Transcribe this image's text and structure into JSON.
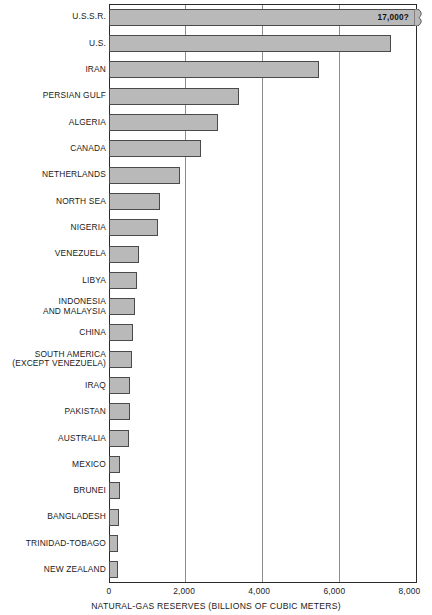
{
  "chart_data": {
    "type": "bar",
    "orientation": "horizontal",
    "title": "",
    "xlabel": "NATURAL-GAS RESERVES (BILLIONS OF CUBIC METERS)",
    "ylabel": "",
    "xlim": [
      0,
      8200
    ],
    "xticks": [
      0,
      2000,
      4000,
      6000,
      8000
    ],
    "xtick_labels": [
      "0",
      "2,000",
      "4,000",
      "6,000",
      "8,000"
    ],
    "grid": "vertical",
    "legend": "none",
    "bar_color": "#b9b9b9",
    "bar_edge_color": "#4a4a4a",
    "categories": [
      "U.S.S.R.",
      "U.S.",
      "IRAN",
      "PERSIAN GULF",
      "ALGERIA",
      "CANADA",
      "NETHERLANDS",
      "NORTH SEA",
      "NIGERIA",
      "VENEZUELA",
      "LIBYA",
      "INDONESIA\nAND MALAYSIA",
      "CHINA",
      "SOUTH AMERICA\n(EXCEPT VENEZUELA)",
      "IRAQ",
      "PAKISTAN",
      "AUSTRALIA",
      "MEXICO",
      "BRUNEI",
      "BANGLADESH",
      "TRINIDAD-TOBAGO",
      "NEW ZEALAND"
    ],
    "values": [
      17000,
      7500,
      5600,
      3450,
      2900,
      2450,
      1900,
      1350,
      1300,
      800,
      750,
      700,
      650,
      600,
      560,
      550,
      540,
      300,
      280,
      270,
      250,
      230
    ],
    "annotations": [
      {
        "category": "U.S.S.R.",
        "text": "17,000?",
        "note": "bar is broken/truncated at the axis edge"
      }
    ]
  }
}
